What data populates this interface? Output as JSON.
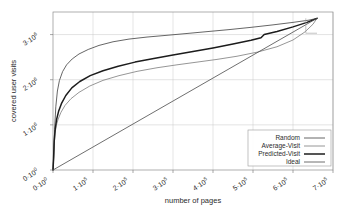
{
  "chart_data": {
    "type": "line",
    "title": "",
    "xlabel": "number of pages",
    "ylabel": "covered user visits",
    "xlim": [
      0,
      700000
    ],
    "ylim": [
      0,
      3500000
    ],
    "grid": true,
    "legend_position": "bottom-right",
    "x_ticks": [
      {
        "value": 0,
        "label": "0·10",
        "exp": "0"
      },
      {
        "value": 100000,
        "label": "1·10",
        "exp": "5"
      },
      {
        "value": 200000,
        "label": "2·10",
        "exp": "5"
      },
      {
        "value": 300000,
        "label": "3·10",
        "exp": "5"
      },
      {
        "value": 400000,
        "label": "4·10",
        "exp": "5"
      },
      {
        "value": 500000,
        "label": "5·10",
        "exp": "5"
      },
      {
        "value": 600000,
        "label": "6·10",
        "exp": "5"
      },
      {
        "value": 700000,
        "label": "7·10",
        "exp": "5"
      }
    ],
    "y_ticks": [
      {
        "value": 0,
        "label": "0·10",
        "exp": "0"
      },
      {
        "value": 1000000,
        "label": "1·10",
        "exp": "6"
      },
      {
        "value": 2000000,
        "label": "2·10",
        "exp": "6"
      },
      {
        "value": 3000000,
        "label": "3·10",
        "exp": "6"
      }
    ],
    "series": [
      {
        "name": "Random",
        "color": "#555555",
        "width": 0.9,
        "points": [
          [
            0,
            0
          ],
          [
            2000,
            350000
          ],
          [
            4000,
            900000
          ],
          [
            7000,
            1400000
          ],
          [
            11000,
            1750000
          ],
          [
            16000,
            1980000
          ],
          [
            24000,
            2180000
          ],
          [
            34000,
            2330000
          ],
          [
            48000,
            2460000
          ],
          [
            65000,
            2570000
          ],
          [
            88000,
            2670000
          ],
          [
            115000,
            2760000
          ],
          [
            150000,
            2840000
          ],
          [
            190000,
            2900000
          ],
          [
            235000,
            2945000
          ],
          [
            280000,
            2980000
          ],
          [
            330000,
            3020000
          ],
          [
            385000,
            3065000
          ],
          [
            440000,
            3110000
          ],
          [
            495000,
            3160000
          ],
          [
            550000,
            3215000
          ],
          [
            600000,
            3270000
          ],
          [
            640000,
            3320000
          ],
          [
            660000,
            3360000
          ]
        ]
      },
      {
        "name": "Average-Visit",
        "color": "#8a8a8a",
        "width": 0.9,
        "points": [
          [
            0,
            0
          ],
          [
            1500,
            220000
          ],
          [
            3000,
            560000
          ],
          [
            5000,
            800000
          ],
          [
            8000,
            980000
          ],
          [
            13000,
            1130000
          ],
          [
            20000,
            1280000
          ],
          [
            30000,
            1430000
          ],
          [
            45000,
            1580000
          ],
          [
            65000,
            1720000
          ],
          [
            92000,
            1860000
          ],
          [
            125000,
            1985000
          ],
          [
            165000,
            2090000
          ],
          [
            210000,
            2185000
          ],
          [
            260000,
            2265000
          ],
          [
            310000,
            2330000
          ],
          [
            360000,
            2390000
          ],
          [
            410000,
            2450000
          ],
          [
            460000,
            2520000
          ],
          [
            510000,
            2610000
          ],
          [
            560000,
            2730000
          ],
          [
            600000,
            2880000
          ],
          [
            630000,
            3060000
          ],
          [
            650000,
            3230000
          ],
          [
            660000,
            3360000
          ]
        ]
      },
      {
        "name": "Predicted-Visit",
        "color": "#1c1c1c",
        "width": 1.5,
        "points": [
          [
            0,
            0
          ],
          [
            1500,
            260000
          ],
          [
            3000,
            640000
          ],
          [
            5500,
            900000
          ],
          [
            9000,
            1120000
          ],
          [
            14000,
            1300000
          ],
          [
            21000,
            1470000
          ],
          [
            32000,
            1650000
          ],
          [
            47000,
            1820000
          ],
          [
            67000,
            1960000
          ],
          [
            93000,
            2090000
          ],
          [
            125000,
            2200000
          ],
          [
            163000,
            2300000
          ],
          [
            205000,
            2390000
          ],
          [
            252000,
            2470000
          ],
          [
            300000,
            2545000
          ],
          [
            350000,
            2625000
          ],
          [
            400000,
            2705000
          ],
          [
            450000,
            2790000
          ],
          [
            495000,
            2875000
          ],
          [
            520000,
            2930000
          ],
          [
            528000,
            3000000
          ],
          [
            560000,
            3070000
          ],
          [
            600000,
            3170000
          ],
          [
            635000,
            3270000
          ],
          [
            660000,
            3360000
          ]
        ]
      },
      {
        "name": "Ideal",
        "color": "#4a4a4a",
        "width": 0.8,
        "points": [
          [
            0,
            0
          ],
          [
            660000,
            3360000
          ]
        ]
      }
    ],
    "annotations": [
      {
        "name": "convergence-bracket",
        "points": [
          [
            632000,
            3360000
          ],
          [
            632000,
            3030000
          ],
          [
            660000,
            3030000
          ]
        ]
      }
    ]
  }
}
